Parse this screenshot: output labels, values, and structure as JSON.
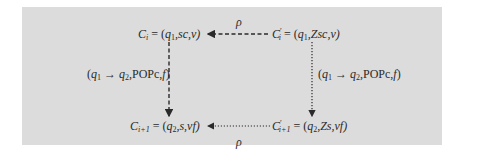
{
  "diagram": {
    "nodes": {
      "top_left": {
        "name": "C",
        "sub": "i",
        "prime": "",
        "eq": " = (",
        "state": "q",
        "state_sub": "1",
        "rest": ",sc,v)"
      },
      "top_right": {
        "name": "C",
        "sub": "i",
        "prime": "′",
        "eq": " = (",
        "state": "q",
        "state_sub": "1",
        "rest": ",Zsc,v)"
      },
      "bottom_left": {
        "name": "C",
        "sub": "i+1",
        "prime": "",
        "eq": " = (",
        "state": "q",
        "state_sub": "2",
        "rest": ",s,vf)"
      },
      "bottom_right": {
        "name": "C",
        "sub": "i+1",
        "prime": "′",
        "eq": " = (",
        "state": "q",
        "state_sub": "2",
        "rest": ",Zs,vf)"
      }
    },
    "edges": {
      "top": {
        "label": "ρ",
        "style": "dashed",
        "from": "top_right",
        "to": "top_left"
      },
      "bottom": {
        "label": "ρ",
        "style": "dotted",
        "from": "bottom_right",
        "to": "bottom_left"
      },
      "left": {
        "style": "dashed",
        "from": "top_left",
        "to": "bottom_left",
        "label_open": "(",
        "q_from": "q",
        "q_from_sub": "1",
        "arrow": " → ",
        "q_to": "q",
        "q_to_sub": "2",
        "label_rest": ",POPc,",
        "f": "f",
        "label_close": ")"
      },
      "right": {
        "style": "dotted",
        "from": "top_right",
        "to": "bottom_right",
        "label_open": "(",
        "q_from": "q",
        "q_from_sub": "1",
        "arrow": " → ",
        "q_to": "q",
        "q_to_sub": "2",
        "label_rest": ",POPc,",
        "f": "f",
        "label_close": ")"
      }
    }
  },
  "colors": {
    "panel": "#dcdcdc",
    "ink": "#2a2a2a"
  }
}
